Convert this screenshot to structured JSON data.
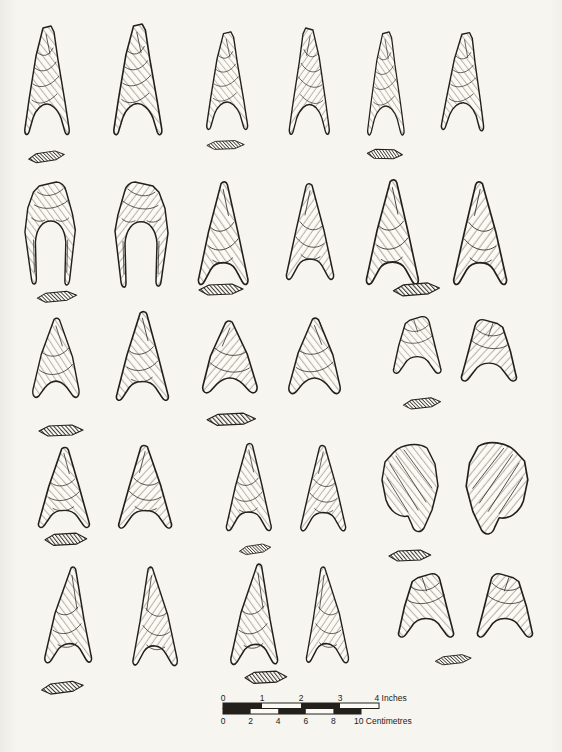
{
  "palette": {
    "paper": "#f6f5f0",
    "ink": "#23201b",
    "artifact_fill": "#fbfaf5"
  },
  "plate": {
    "content": "line-drawn flint arrowheads with lenticular cross-sections",
    "total_points": 30,
    "total_cross_sections": 15,
    "rows": [
      {
        "index": 1,
        "points": 6,
        "cross_sections": 3,
        "form": "tall narrow points with deep hollow bases"
      },
      {
        "index": 2,
        "points": 6,
        "cross_sections": 3,
        "form": "broad points with deep hollow bases and long basal spurs"
      },
      {
        "index": 3,
        "points": 6,
        "cross_sections": 3,
        "form": "squat triangular points with shallow concave bases"
      },
      {
        "index": 4,
        "points": 6,
        "cross_sections": 3,
        "form": "small triangular points and two blade-like forms"
      },
      {
        "index": 5,
        "points": 6,
        "cross_sections": 3,
        "form": "asymmetric triangular and hollow-based points"
      }
    ]
  },
  "scale_bar": {
    "inches": {
      "ticks": [
        "0",
        "1",
        "2",
        "3"
      ],
      "end": "4 Inches"
    },
    "centimetres": {
      "ticks": [
        "0",
        "2",
        "4",
        "6",
        "8"
      ],
      "end": "10 Centimetres"
    }
  }
}
